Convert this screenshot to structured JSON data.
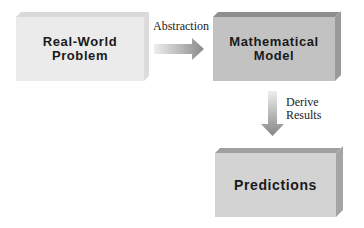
{
  "diagram": {
    "nodes": [
      {
        "id": "real-world-problem",
        "label": "Real-World\nProblem"
      },
      {
        "id": "mathematical-model",
        "label": "Mathematical\nModel"
      },
      {
        "id": "predictions",
        "label": "Predictions"
      }
    ],
    "edges": [
      {
        "from": "real-world-problem",
        "to": "mathematical-model",
        "label": "Abstraction"
      },
      {
        "from": "mathematical-model",
        "to": "predictions",
        "label": "Derive\nResults"
      }
    ]
  },
  "colors": {
    "box1_face": "#ebebeb",
    "box2_face": "#c2c2c2",
    "box3_face": "#d3d3d3",
    "arrow_dark": "#8a8a8a",
    "arrow_light": "#e6e6e6"
  }
}
